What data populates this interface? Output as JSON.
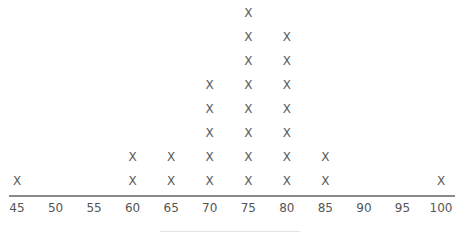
{
  "chart_data": {
    "type": "dot_plot",
    "title": "",
    "xlabel": "",
    "ylabel": "",
    "marker": "X",
    "x_ticks": [
      45,
      50,
      55,
      60,
      65,
      70,
      75,
      80,
      85,
      90,
      95,
      100
    ],
    "xlim": [
      45,
      100
    ],
    "grid": false,
    "legend": null,
    "categories": [
      45,
      50,
      55,
      60,
      65,
      70,
      75,
      80,
      85,
      90,
      95,
      100
    ],
    "values": [
      1,
      0,
      0,
      2,
      2,
      5,
      8,
      7,
      2,
      0,
      0,
      1
    ],
    "note": "x-axis label is cropped at the bottom edge and not legible"
  },
  "axis": {
    "tick_labels": [
      "45",
      "50",
      "55",
      "60",
      "65",
      "70",
      "75",
      "80",
      "85",
      "90",
      "95",
      "100"
    ]
  },
  "colors": {
    "marker": "#5a5a5a",
    "axis": "#8a8a8a",
    "text": "#555555"
  }
}
